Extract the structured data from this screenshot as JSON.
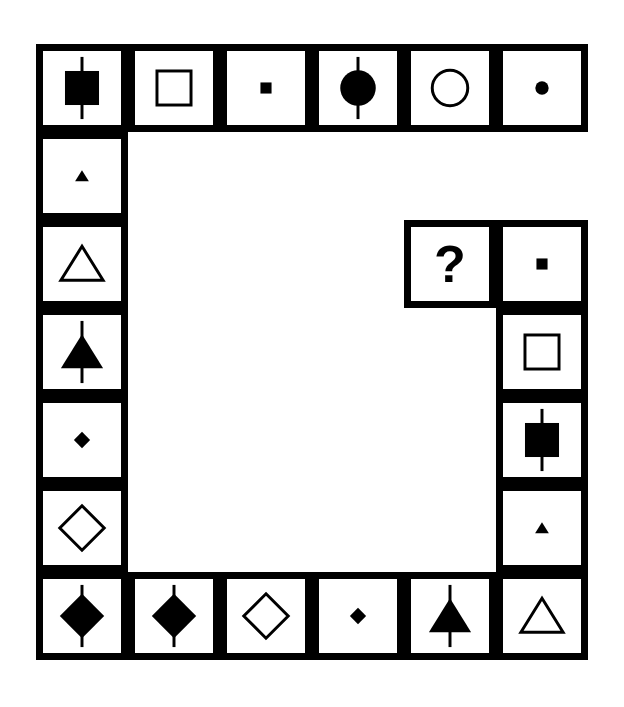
{
  "puzzle": {
    "title": "Matrix reasoning puzzle",
    "description": "A square ring of framed cells containing geometric symbols with one missing cell marked by a question mark.",
    "colors": {
      "ink": "#000000",
      "paper": "#ffffff"
    },
    "grid": {
      "columns": 6,
      "rows": 7,
      "cell_width": 92,
      "cell_height": 88,
      "border_thickness": 7
    },
    "missing_cell_marker": "?",
    "cells": [
      {
        "id": "r1c1",
        "row": 1,
        "col": 1,
        "shape": "square",
        "fill": "filled",
        "size": "large",
        "line": true,
        "label": "filled square with vertical line"
      },
      {
        "id": "r1c2",
        "row": 1,
        "col": 2,
        "shape": "square",
        "fill": "outline",
        "size": "large",
        "line": false,
        "label": "outline square"
      },
      {
        "id": "r1c3",
        "row": 1,
        "col": 3,
        "shape": "square",
        "fill": "filled",
        "size": "small",
        "line": false,
        "label": "small filled square"
      },
      {
        "id": "r1c4",
        "row": 1,
        "col": 4,
        "shape": "circle",
        "fill": "filled",
        "size": "large",
        "line": true,
        "label": "filled circle with vertical line"
      },
      {
        "id": "r1c5",
        "row": 1,
        "col": 5,
        "shape": "circle",
        "fill": "outline",
        "size": "large",
        "line": false,
        "label": "outline circle"
      },
      {
        "id": "r1c6",
        "row": 1,
        "col": 6,
        "shape": "circle",
        "fill": "filled",
        "size": "small",
        "line": false,
        "label": "small filled circle"
      },
      {
        "id": "r2c1",
        "row": 2,
        "col": 1,
        "shape": "triangle",
        "fill": "filled",
        "size": "small",
        "line": false,
        "label": "small filled triangle"
      },
      {
        "id": "r3c1",
        "row": 3,
        "col": 1,
        "shape": "triangle",
        "fill": "outline",
        "size": "large",
        "line": false,
        "label": "outline triangle"
      },
      {
        "id": "r4c1",
        "row": 4,
        "col": 1,
        "shape": "triangle",
        "fill": "filled",
        "size": "large",
        "line": true,
        "label": "filled triangle with vertical line"
      },
      {
        "id": "r5c1",
        "row": 5,
        "col": 1,
        "shape": "diamond",
        "fill": "filled",
        "size": "small",
        "line": false,
        "label": "small filled diamond"
      },
      {
        "id": "r6c1",
        "row": 6,
        "col": 1,
        "shape": "diamond",
        "fill": "outline",
        "size": "large",
        "line": false,
        "label": "outline diamond"
      },
      {
        "id": "r3c5",
        "row": 3,
        "col": 5,
        "shape": "question",
        "fill": "none",
        "size": "large",
        "line": false,
        "label": "question mark"
      },
      {
        "id": "r3c6",
        "row": 3,
        "col": 6,
        "shape": "square",
        "fill": "filled",
        "size": "small",
        "line": false,
        "label": "small filled square"
      },
      {
        "id": "r4c6",
        "row": 4,
        "col": 6,
        "shape": "square",
        "fill": "outline",
        "size": "large",
        "line": false,
        "label": "outline square"
      },
      {
        "id": "r5c6",
        "row": 5,
        "col": 6,
        "shape": "square",
        "fill": "filled",
        "size": "large",
        "line": true,
        "label": "filled square with vertical line"
      },
      {
        "id": "r6c6",
        "row": 6,
        "col": 6,
        "shape": "triangle",
        "fill": "filled",
        "size": "small",
        "line": false,
        "label": "small filled triangle"
      },
      {
        "id": "r7c1",
        "row": 7,
        "col": 1,
        "shape": "diamond",
        "fill": "filled",
        "size": "large",
        "line": true,
        "label": "filled diamond with vertical line"
      },
      {
        "id": "r7c2",
        "row": 7,
        "col": 2,
        "shape": "diamond",
        "fill": "filled",
        "size": "large",
        "line": true,
        "label": "filled diamond with vertical line"
      },
      {
        "id": "r7c3",
        "row": 7,
        "col": 3,
        "shape": "diamond",
        "fill": "outline",
        "size": "large",
        "line": false,
        "label": "outline diamond"
      },
      {
        "id": "r7c4",
        "row": 7,
        "col": 4,
        "shape": "diamond",
        "fill": "filled",
        "size": "small",
        "line": false,
        "label": "small filled diamond"
      },
      {
        "id": "r7c5",
        "row": 7,
        "col": 5,
        "shape": "triangle",
        "fill": "filled",
        "size": "large",
        "line": true,
        "label": "filled triangle with vertical line"
      },
      {
        "id": "r7c6",
        "row": 7,
        "col": 6,
        "shape": "triangle",
        "fill": "outline",
        "size": "large",
        "line": false,
        "label": "outline triangle"
      }
    ]
  }
}
